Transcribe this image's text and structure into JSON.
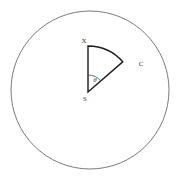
{
  "figure": {
    "name": "circle-with-sector",
    "background_color": "#ffffff",
    "width": 177,
    "height": 179
  },
  "circle": {
    "name": "outer-circle",
    "center_x": 90,
    "center_y": 90,
    "radius": 79,
    "stroke_color": "#6b6b6b",
    "stroke_width": 0.9,
    "fill": "none"
  },
  "sector": {
    "name": "sector-SXC",
    "apex_x": 88,
    "apex_y": 92,
    "radius": 46,
    "start_angle_deg": 90,
    "end_angle_deg": 41,
    "stroke_color": "#1b1b1b",
    "stroke_width": 1.4,
    "fill": "none"
  },
  "points": {
    "apex": {
      "label": "S",
      "x": 88,
      "y": 92,
      "label_x": 85,
      "label_y": 99
    },
    "arc_start": {
      "label": "X",
      "x": 88,
      "y": 46,
      "label_x": 84,
      "label_y": 41
    },
    "arc_end": {
      "label": "C",
      "x": 123,
      "y": 62,
      "label_x": 141,
      "label_y": 64
    }
  },
  "angle_marker": {
    "name": "angle-theta",
    "label": "θ",
    "radius": 17,
    "label_x": 95,
    "label_y": 80,
    "stroke_color": "#4a4a4a",
    "stroke_width": 0.8
  },
  "labels": {
    "apex_text": "S",
    "arc_start_text": "X",
    "arc_end_text": "C",
    "angle_text": "θ"
  }
}
